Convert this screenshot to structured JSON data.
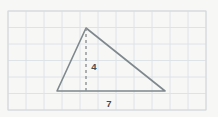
{
  "figure": {
    "background_color": "#f7f7f6",
    "grid": {
      "name": "graph-paper-grid",
      "line_color": "#dee3e7",
      "border_color": "#d2d8dc",
      "x_start": 8,
      "y_start": 11,
      "x_end": 206,
      "y_end": 110,
      "columns": 11,
      "rows": 6,
      "cell_width": 18,
      "cell_height": 16.5
    },
    "shape": {
      "name": "triangle",
      "type": "triangle",
      "stroke_color": "#7f888d",
      "stroke_width": 1.6,
      "vertices": {
        "apex": {
          "x": 86,
          "y": 28
        },
        "bottom_left": {
          "x": 57,
          "y": 91
        },
        "bottom_right": {
          "x": 165,
          "y": 91
        }
      }
    },
    "altitude": {
      "name": "height-dashed-line",
      "stroke_color": "#8a9196",
      "stroke_width": 1.4,
      "dash_pattern": "3 3",
      "from": {
        "x": 86,
        "y": 28
      },
      "to": {
        "x": 86,
        "y": 91
      }
    },
    "labels": {
      "height": {
        "text": "4",
        "x": 94,
        "y": 67,
        "color": "#4a4a4a"
      },
      "base": {
        "text": "7",
        "x": 109,
        "y": 104,
        "color": "#4a4a4a"
      }
    }
  },
  "chart_data": {
    "type": "diagram",
    "shape": "triangle",
    "measurements": [
      {
        "name": "height",
        "value": 4,
        "label": "4",
        "orientation": "vertical",
        "style": "dashed"
      },
      {
        "name": "base",
        "value": 7,
        "label": "7",
        "orientation": "horizontal",
        "style": "solid"
      }
    ],
    "area": 14,
    "grid": true,
    "grid_columns": 11,
    "grid_rows": 6,
    "xlabel": "",
    "ylabel": ""
  }
}
